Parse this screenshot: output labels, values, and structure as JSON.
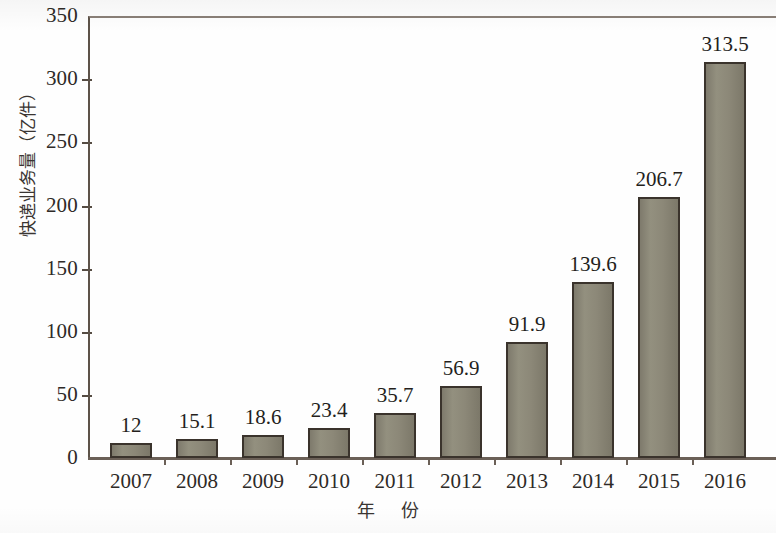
{
  "chart_data": {
    "type": "bar",
    "title": "",
    "subtitle": "",
    "xlabel": "年  份",
    "ylabel": "快递业务量（亿件）",
    "categories": [
      "2007",
      "2008",
      "2009",
      "2010",
      "2011",
      "2012",
      "2013",
      "2014",
      "2015",
      "2016"
    ],
    "values": [
      12,
      15.1,
      18.6,
      23.4,
      35.7,
      56.9,
      91.9,
      139.6,
      206.7,
      313.5
    ],
    "value_labels": [
      "12",
      "15.1",
      "18.6",
      "23.4",
      "35.7",
      "56.9",
      "91.9",
      "139.6",
      "206.7",
      "313.5"
    ],
    "ylim": [
      0,
      350
    ],
    "yticks": [
      0,
      50,
      100,
      150,
      200,
      250,
      300,
      350
    ],
    "ytick_labels": [
      "0",
      "50",
      "100",
      "150",
      "200",
      "250",
      "300",
      "350"
    ],
    "grid": false,
    "legend": null,
    "bar_color": "#8c8878",
    "bar_border_color": "#3a332c",
    "axis_color": "#6b6057",
    "background": "#ffffff"
  }
}
